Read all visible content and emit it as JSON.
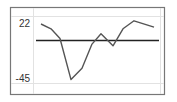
{
  "chart_data": {
    "type": "line",
    "title": "",
    "xlabel": "",
    "ylabel": "",
    "y_tick_labels": [
      "22",
      "-45"
    ],
    "ylim": [
      -45,
      22
    ],
    "x": [
      1,
      2,
      3,
      4,
      5,
      6,
      7,
      8,
      9,
      10,
      11
    ],
    "series": [
      {
        "name": "value",
        "values": [
          22,
          16,
          4,
          -47,
          -33,
          -3,
          10,
          -5,
          16,
          26,
          18
        ],
        "color": "#555555"
      }
    ],
    "reference_line": {
      "value": 2,
      "color": "#222222"
    },
    "grid": true,
    "legend": "none"
  },
  "labels": {
    "y_max": "22",
    "y_min": "-45"
  },
  "colors": {
    "frame": "#777777",
    "grid": "#e2e2e2",
    "line": "#555555",
    "baseline": "#222222"
  }
}
